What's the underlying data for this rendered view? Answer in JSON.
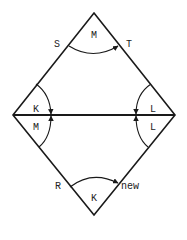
{
  "diagram": {
    "type": "rhombus-with-diagonal",
    "stroke_color": "#1a1a1a",
    "labels": {
      "top_left": "S",
      "top_center": "M",
      "top_right": "T",
      "mid_left_upper": "K",
      "mid_right_upper": "L",
      "mid_left_lower": "M",
      "mid_right_lower": "L",
      "bottom_left": "R",
      "bottom_center": "K",
      "bottom_right": "new"
    }
  }
}
